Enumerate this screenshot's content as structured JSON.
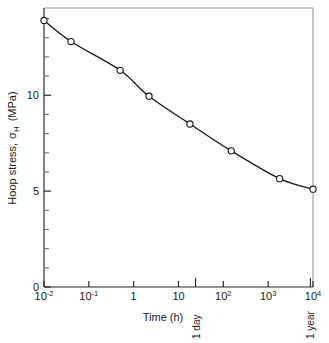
{
  "chart_data": {
    "type": "line",
    "title": "",
    "xlabel": "Time (h)",
    "ylabel": "Hoop stress, σH  (MPa)",
    "ylabel_main": "Hoop stress,",
    "ylabel_symbol": "σ",
    "ylabel_sub": "H",
    "ylabel_units": "(MPa)",
    "xscale": "log",
    "yscale": "linear",
    "xlim": [
      0.01,
      10000
    ],
    "ylim": [
      0,
      14.55
    ],
    "grid": false,
    "legend": null,
    "xtick_labels": [
      "10-2",
      "10-1",
      "1",
      "10",
      "102",
      "103",
      "104"
    ],
    "xticks": [
      {
        "value": 0.01,
        "mantissa": "10",
        "exponent": "-2"
      },
      {
        "value": 0.1,
        "mantissa": "10",
        "exponent": "-1"
      },
      {
        "value": 1,
        "mantissa": "1",
        "exponent": ""
      },
      {
        "value": 10,
        "mantissa": "10",
        "exponent": ""
      },
      {
        "value": 100,
        "mantissa": "10",
        "exponent": "2"
      },
      {
        "value": 1000,
        "mantissa": "10",
        "exponent": "3"
      },
      {
        "value": 10000,
        "mantissa": "10",
        "exponent": "4"
      }
    ],
    "yticks_labeled": [
      {
        "value": 0,
        "label": "0"
      },
      {
        "value": 5,
        "label": "5"
      },
      {
        "value": 10,
        "label": "10"
      }
    ],
    "ytick_minor_step": 1,
    "annotations": [
      {
        "text": "1 day",
        "x": 24,
        "orientation": "vertical",
        "tick": true
      },
      {
        "text": "1 year",
        "x": 8760,
        "orientation": "vertical",
        "tick": true
      }
    ],
    "series": [
      {
        "name": "Hoop stress vs time",
        "marker": "open-circle",
        "points": [
          {
            "x": 0.01,
            "y": 13.9
          },
          {
            "x": 0.04,
            "y": 12.8
          },
          {
            "x": 0.5,
            "y": 11.3
          },
          {
            "x": 2.2,
            "y": 9.95
          },
          {
            "x": 18,
            "y": 8.5
          },
          {
            "x": 150,
            "y": 7.1
          },
          {
            "x": 1800,
            "y": 5.65
          },
          {
            "x": 10000,
            "y": 5.1
          }
        ]
      }
    ]
  }
}
